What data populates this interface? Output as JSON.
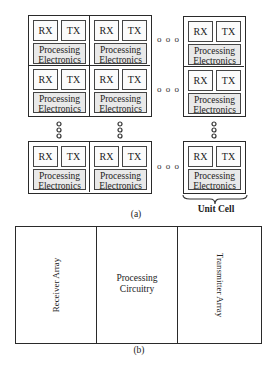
{
  "figure_a": {
    "caption": "(a)",
    "cell": {
      "rx_label": "RX",
      "tx_label": "TX",
      "pe_line1": "Processing",
      "pe_line2": "Electronics"
    },
    "unit_cell_label": "Unit Cell",
    "ellipsis_horizontal": "o o o",
    "ellipsis_vertical": "o\no\no"
  },
  "figure_b": {
    "caption": "(b)",
    "sections": [
      {
        "label": "Receiver Array",
        "orientation": "vertical-up"
      },
      {
        "label_line1": "Processing",
        "label_line2": "Circuitry",
        "orientation": "horizontal"
      },
      {
        "label": "Transmitter Array",
        "orientation": "vertical-down"
      }
    ]
  }
}
